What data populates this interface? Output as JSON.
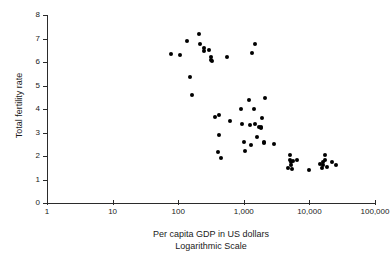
{
  "chart_data": {
    "type": "scatter",
    "title": "",
    "xlabel": "Per capita GDP in US dollars",
    "xlabel_line2": "Logarithmic Scale",
    "ylabel": "Total fertility rate",
    "xscale": "log",
    "yscale": "linear",
    "xlim": [
      1,
      100000
    ],
    "ylim": [
      0,
      8
    ],
    "grid": false,
    "legend": null,
    "xticks": [
      1,
      10,
      100,
      1000,
      10000,
      100000
    ],
    "xtick_labels": [
      "1",
      "10",
      "100",
      "1,000",
      "10,000",
      "100,000"
    ],
    "yticks": [
      0,
      1,
      2,
      3,
      4,
      5,
      6,
      7,
      8
    ],
    "ytick_labels": [
      "0",
      "1",
      "2",
      "3",
      "4",
      "5",
      "6",
      "7",
      "8"
    ],
    "marker": "filled-circle",
    "marker_color": "#000000",
    "points": [
      {
        "x": 78,
        "y": 6.35
      },
      {
        "x": 108,
        "y": 6.3
      },
      {
        "x": 135,
        "y": 6.9
      },
      {
        "x": 152,
        "y": 5.35
      },
      {
        "x": 160,
        "y": 4.6
      },
      {
        "x": 205,
        "y": 7.2
      },
      {
        "x": 215,
        "y": 6.75
      },
      {
        "x": 248,
        "y": 6.6
      },
      {
        "x": 245,
        "y": 6.45
      },
      {
        "x": 300,
        "y": 6.5
      },
      {
        "x": 320,
        "y": 6.2
      },
      {
        "x": 320,
        "y": 6.1
      },
      {
        "x": 325,
        "y": 6.05
      },
      {
        "x": 560,
        "y": 6.2
      },
      {
        "x": 1350,
        "y": 6.4
      },
      {
        "x": 1500,
        "y": 6.75
      },
      {
        "x": 360,
        "y": 3.65
      },
      {
        "x": 420,
        "y": 3.75
      },
      {
        "x": 415,
        "y": 2.9
      },
      {
        "x": 400,
        "y": 2.15
      },
      {
        "x": 455,
        "y": 1.9
      },
      {
        "x": 620,
        "y": 3.5
      },
      {
        "x": 900,
        "y": 4.0
      },
      {
        "x": 930,
        "y": 3.35
      },
      {
        "x": 1000,
        "y": 2.6
      },
      {
        "x": 1030,
        "y": 2.2
      },
      {
        "x": 1200,
        "y": 4.4
      },
      {
        "x": 1250,
        "y": 3.3
      },
      {
        "x": 1280,
        "y": 2.45
      },
      {
        "x": 1450,
        "y": 4.0
      },
      {
        "x": 1500,
        "y": 3.35
      },
      {
        "x": 1600,
        "y": 2.8
      },
      {
        "x": 1700,
        "y": 3.25
      },
      {
        "x": 1800,
        "y": 3.2
      },
      {
        "x": 1850,
        "y": 3.25
      },
      {
        "x": 1900,
        "y": 3.6
      },
      {
        "x": 2000,
        "y": 2.6
      },
      {
        "x": 2050,
        "y": 2.55
      },
      {
        "x": 2100,
        "y": 4.45
      },
      {
        "x": 2900,
        "y": 2.5
      },
      {
        "x": 4700,
        "y": 1.5
      },
      {
        "x": 5000,
        "y": 2.05
      },
      {
        "x": 5100,
        "y": 1.85
      },
      {
        "x": 5200,
        "y": 1.75
      },
      {
        "x": 5300,
        "y": 1.6
      },
      {
        "x": 5400,
        "y": 1.45
      },
      {
        "x": 5600,
        "y": 1.8
      },
      {
        "x": 6400,
        "y": 1.85
      },
      {
        "x": 9800,
        "y": 1.4
      },
      {
        "x": 14500,
        "y": 1.65
      },
      {
        "x": 15500,
        "y": 1.5
      },
      {
        "x": 16000,
        "y": 1.75
      },
      {
        "x": 16200,
        "y": 1.6
      },
      {
        "x": 17000,
        "y": 2.05
      },
      {
        "x": 17500,
        "y": 1.85
      },
      {
        "x": 18500,
        "y": 1.55
      },
      {
        "x": 22000,
        "y": 1.75
      },
      {
        "x": 25000,
        "y": 1.6
      }
    ]
  }
}
